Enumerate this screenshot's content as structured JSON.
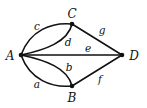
{
  "graph": {
    "vertices": [
      {
        "id": "A",
        "label": "A",
        "x": 21,
        "y": 55,
        "lx": 10,
        "ly": 60
      },
      {
        "id": "B",
        "label": "B",
        "x": 72,
        "y": 86,
        "lx": 72,
        "ly": 102
      },
      {
        "id": "C",
        "label": "C",
        "x": 72,
        "y": 24,
        "lx": 72,
        "ly": 18
      },
      {
        "id": "D",
        "label": "D",
        "x": 122,
        "y": 55,
        "lx": 134,
        "ly": 60
      }
    ],
    "edges": [
      {
        "id": "a",
        "label": "a",
        "from": "A",
        "to": "B",
        "lx": 37,
        "ly": 88
      },
      {
        "id": "b",
        "label": "b",
        "from": "A",
        "to": "B",
        "lx": 69,
        "ly": 71
      },
      {
        "id": "c",
        "label": "c",
        "from": "A",
        "to": "C",
        "lx": 37,
        "ly": 30
      },
      {
        "id": "d",
        "label": "d",
        "from": "A",
        "to": "C",
        "lx": 68,
        "ly": 46
      },
      {
        "id": "e",
        "label": "e",
        "from": "A",
        "to": "D",
        "lx": 88,
        "ly": 52
      },
      {
        "id": "f",
        "label": "f",
        "from": "B",
        "to": "D",
        "lx": 100,
        "ly": 83
      },
      {
        "id": "g",
        "label": "g",
        "from": "C",
        "to": "D",
        "lx": 102,
        "ly": 34
      }
    ],
    "color": "#111111"
  }
}
